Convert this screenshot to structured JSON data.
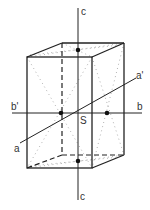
{
  "figure": {
    "colors": {
      "line": "#222222",
      "dots": "#888888",
      "background": "#ffffff"
    }
  },
  "labels": {
    "c_top": "c",
    "c_bottom": "c",
    "b_left": "b'",
    "b_right": "b",
    "a_left": "a",
    "a_right": "a'",
    "center": "S"
  },
  "axes": [
    {
      "name": "c",
      "from": "c",
      "to": "c",
      "orientation": "vertical"
    },
    {
      "name": "b",
      "from": "b'",
      "to": "b",
      "orientation": "horizontal"
    },
    {
      "name": "a",
      "from": "a",
      "to": "a'",
      "orientation": "oblique"
    }
  ],
  "points": [
    {
      "id": "top-face-center"
    },
    {
      "id": "bottom-face-center"
    },
    {
      "id": "back-face-point-left"
    },
    {
      "id": "side-face-point-right"
    }
  ]
}
